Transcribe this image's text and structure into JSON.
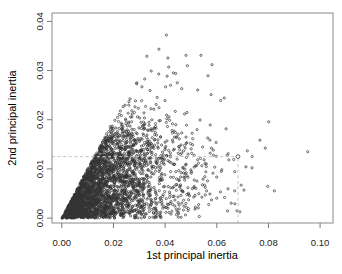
{
  "figure": {
    "background": "#ffffff",
    "style": {
      "point": "#333333",
      "box": "#8a8a8a",
      "tick": "#7a7a7a",
      "label": "#1c1c1c",
      "dash": "#c4c4c4",
      "highlight": "#4a4a4a"
    }
  },
  "chart_data": {
    "type": "scatter",
    "title": "",
    "xlabel": "1st principal inertia",
    "ylabel": "2nd principal inertia",
    "xlim": [
      -0.0038,
      0.105
    ],
    "ylim": [
      -0.001,
      0.0417
    ],
    "x_tick_values": [
      0.0,
      0.02,
      0.04,
      0.06,
      0.08,
      0.1
    ],
    "x_tick_labels": [
      "0.00",
      "0.02",
      "0.04",
      "0.06",
      "0.08",
      "0.10"
    ],
    "y_tick_values": [
      0.0,
      0.01,
      0.02,
      0.03,
      0.04
    ],
    "y_tick_labels": [
      "0.00",
      "0.01",
      "0.02",
      "0.03",
      "0.04"
    ],
    "grid": false,
    "legend": null,
    "marker": {
      "shape": "open-circle",
      "radius_px": 1.1,
      "highlight_radius_px": 1.9
    },
    "points_model": {
      "comment": "Dense permutation-test style cloud of ~3200 open circles, constrained y <= x, solid triangular mass near origin fading by y~0.015, x tail to ~0.086",
      "n": 3200,
      "seed": 20,
      "x_gamma_shape": 2,
      "x_scale": 0.0098,
      "x_max": 0.086,
      "y_constraint": "y <= x",
      "y_uniform_knee": 0.0145,
      "y_tail_decay": 0.0042
    },
    "notable_points": [
      [
        0.0405,
        0.0372
      ],
      [
        0.0329,
        0.0329
      ],
      [
        0.0481,
        0.0331
      ],
      [
        0.0539,
        0.0331
      ],
      [
        0.0346,
        0.0299
      ],
      [
        0.0414,
        0.0307
      ],
      [
        0.0375,
        0.0293
      ],
      [
        0.0432,
        0.0295
      ],
      [
        0.029,
        0.0273
      ],
      [
        0.031,
        0.0267
      ],
      [
        0.0402,
        0.0267
      ],
      [
        0.0447,
        0.0275
      ],
      [
        0.0464,
        0.0263
      ],
      [
        0.0578,
        0.0251
      ],
      [
        0.0629,
        0.0244
      ],
      [
        0.0644,
        0.0131
      ],
      [
        0.064,
        0.0127
      ],
      [
        0.0952,
        0.0135
      ]
    ],
    "highlight_point": [
      0.0682,
      0.0125
    ],
    "reference_lines": {
      "style": "dashed",
      "h_y": 0.0125,
      "h_x_from": -0.0038,
      "h_x_to": 0.0682,
      "v_x": 0.0682,
      "v_y_from": -0.001,
      "v_y_to": 0.0125
    }
  }
}
